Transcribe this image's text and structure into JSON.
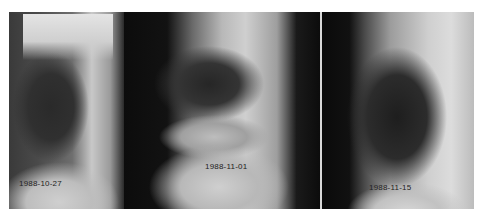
{
  "figure": {
    "panels": [
      {
        "label": "1988-10-27"
      },
      {
        "label": "1988-11-01"
      },
      {
        "label": "1988-11-15"
      }
    ]
  }
}
